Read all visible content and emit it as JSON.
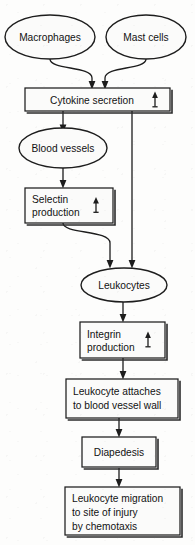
{
  "diagram": {
    "background_color": "#fdfdfc",
    "line_color": "#1d1d1d",
    "nodes": {
      "macrophages": {
        "label": "Macrophages",
        "shape": "ellipse"
      },
      "mast_cells": {
        "label": "Mast cells",
        "shape": "ellipse"
      },
      "cytokine_secretion": {
        "label": "Cytokine secretion",
        "shape": "rectangle",
        "indicator": "up-arrow"
      },
      "blood_vessels": {
        "label": "Blood vessels",
        "shape": "ellipse"
      },
      "selectin_production": {
        "line1": "Selectin",
        "line2": "production",
        "shape": "rectangle",
        "indicator": "up-arrow"
      },
      "leukocytes": {
        "label": "Leukocytes",
        "shape": "ellipse"
      },
      "integrin_production": {
        "line1": "Integrin",
        "line2": "production",
        "shape": "rectangle",
        "indicator": "up-arrow"
      },
      "leukocyte_attaches": {
        "line1": "Leukocyte attaches",
        "line2": "to blood vessel wall",
        "shape": "rectangle"
      },
      "diapedesis": {
        "label": "Diapedesis",
        "shape": "rectangle"
      },
      "leukocyte_migration": {
        "line1": "Leukocyte migration",
        "line2": "to site of injury",
        "line3": "by chemotaxis",
        "shape": "rectangle"
      }
    },
    "edges": [
      {
        "from": "macrophages",
        "to": "cytokine_secretion",
        "style": "curved"
      },
      {
        "from": "mast_cells",
        "to": "cytokine_secretion",
        "style": "curved"
      },
      {
        "from": "cytokine_secretion",
        "to": "blood_vessels",
        "style": "straight"
      },
      {
        "from": "cytokine_secretion",
        "to": "leukocytes",
        "style": "straight-long"
      },
      {
        "from": "blood_vessels",
        "to": "selectin_production",
        "style": "straight"
      },
      {
        "from": "selectin_production",
        "to": "leukocytes",
        "style": "curved"
      },
      {
        "from": "leukocytes",
        "to": "integrin_production",
        "style": "straight"
      },
      {
        "from": "integrin_production",
        "to": "leukocyte_attaches",
        "style": "straight"
      },
      {
        "from": "leukocyte_attaches",
        "to": "diapedesis",
        "style": "straight"
      },
      {
        "from": "diapedesis",
        "to": "leukocyte_migration",
        "style": "straight"
      }
    ]
  }
}
